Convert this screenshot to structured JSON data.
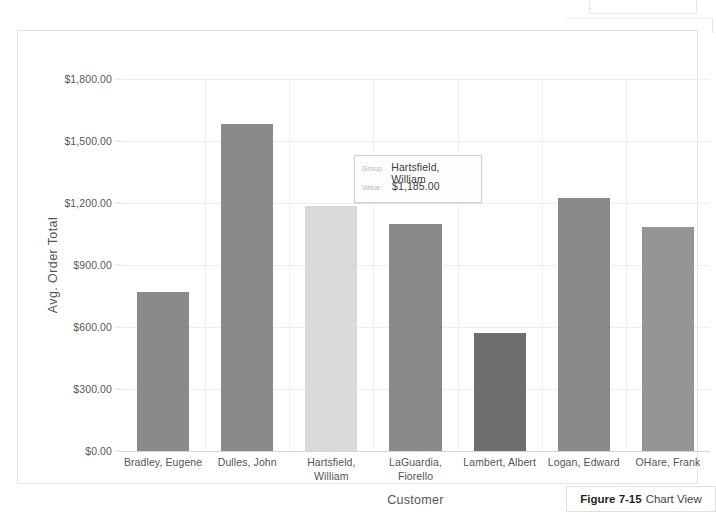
{
  "figure": {
    "caption_number": "Figure 7-15",
    "caption_text": "Chart View"
  },
  "tooltip": {
    "group_label": "Group",
    "group_value": "Hartsfield, William",
    "value_label": "Value",
    "value_value": "$1,185.00"
  },
  "chart_data": {
    "type": "bar",
    "title": "",
    "xlabel": "Customer",
    "ylabel": "Avg. Order Total",
    "ylim": [
      0,
      1800
    ],
    "ytick_values": [
      0,
      300,
      600,
      900,
      1200,
      1500,
      1800
    ],
    "ytick_labels": [
      "$0.00",
      "$300.00",
      "$600.00",
      "$900.00",
      "$1,200.00",
      "$1,500.00",
      "$1,800.00"
    ],
    "grid": true,
    "legend": "none",
    "categories": [
      "Bradley, Eugene",
      "Dulles, John",
      "Hartsfield, William",
      "LaGuardia, Fiorello",
      "Lambert, Albert",
      "Logan, Edward",
      "OHare, Frank"
    ],
    "category_label_lines": [
      [
        "Bradley, Eugene"
      ],
      [
        "Dulles, John"
      ],
      [
        "Hartsfield,",
        "William"
      ],
      [
        "LaGuardia,",
        "Fiorello"
      ],
      [
        "Lambert, Albert"
      ],
      [
        "Logan, Edward"
      ],
      [
        "OHare, Frank"
      ]
    ],
    "values": [
      770,
      1580,
      1185,
      1100,
      570,
      1225,
      1085
    ],
    "bar_colors": [
      "#8a8a8a",
      "#8a8a8a",
      "#d9d9d9",
      "#8a8a8a",
      "#6e6e6e",
      "#8a8a8a",
      "#959595"
    ],
    "highlighted_index": 2,
    "selected_value_label": "$1,185.00"
  },
  "colors": {
    "plot_background": "#ffffff",
    "gridline": "#ededed",
    "axis_line": "#d5d5d5",
    "bar_default": "#8a8a8a",
    "bar_highlight": "#d9d9d9",
    "bar_dark": "#6e6e6e",
    "text": "#545454"
  }
}
